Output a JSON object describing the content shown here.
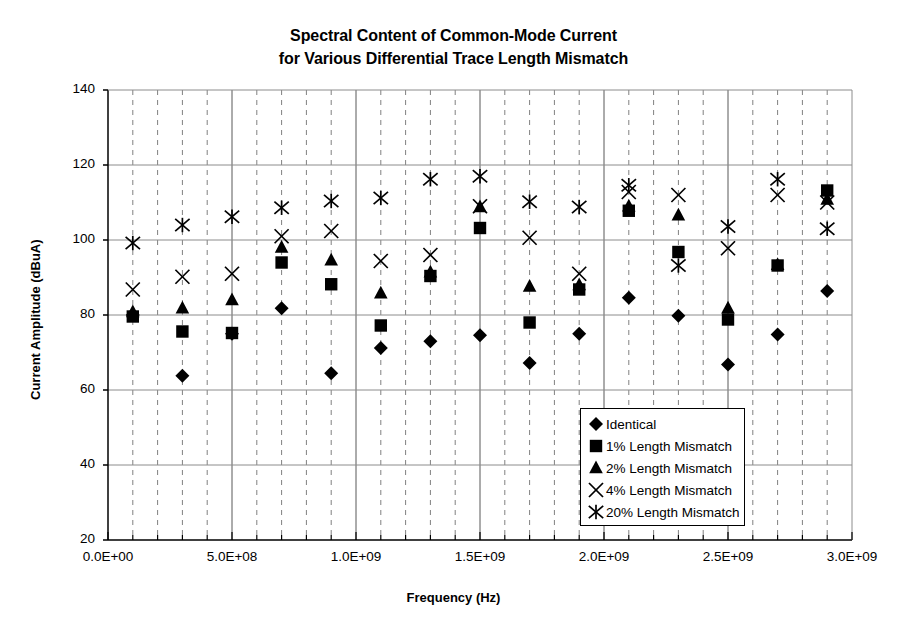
{
  "chart_data": {
    "type": "scatter",
    "title": "Spectral Content of Common-Mode Current for Various Differential Trace Length Mismatch",
    "title_lines": [
      "Spectral Content of Common-Mode Current",
      "for Various Differential Trace Length Mismatch"
    ],
    "xlabel": "Frequency (Hz)",
    "ylabel": "Current Amplitude (dBuA)",
    "xlim": [
      0,
      3000000000
    ],
    "ylim": [
      20,
      140
    ],
    "xticks": [
      0,
      500000000,
      1000000000,
      1500000000,
      2000000000,
      2500000000,
      3000000000
    ],
    "xtick_labels": [
      "0.0E+00",
      "5.0E+08",
      "1.0E+09",
      "1.5E+09",
      "2.0E+09",
      "2.5E+09",
      "3.0E+09"
    ],
    "yticks": [
      20,
      40,
      60,
      80,
      100,
      120,
      140
    ],
    "ytick_labels": [
      "20",
      "40",
      "60",
      "80",
      "100",
      "120",
      "140"
    ],
    "x_minor_step": 100000000,
    "x_major_step": 500000000,
    "grid": "major-horizontal-solid, minor-vertical-dashed, major-vertical-solid",
    "legend_position": "inside lower right",
    "marker_color": "#000000",
    "axis_color": "#000000",
    "grid_color": "#808080",
    "series": [
      {
        "name": "Identical",
        "marker": "diamond",
        "points": [
          [
            100000000,
            80.0
          ],
          [
            300000000,
            63.8
          ],
          [
            500000000,
            75.0
          ],
          [
            700000000,
            81.8
          ],
          [
            900000000,
            64.5
          ],
          [
            1100000000,
            71.2
          ],
          [
            1300000000,
            73.0
          ],
          [
            1500000000,
            74.6
          ],
          [
            1700000000,
            67.2
          ],
          [
            1900000000,
            75.0
          ],
          [
            2100000000,
            84.6
          ],
          [
            2300000000,
            79.8
          ],
          [
            2500000000,
            66.8
          ],
          [
            2700000000,
            74.8
          ],
          [
            2900000000,
            86.4
          ]
        ]
      },
      {
        "name": "1% Length Mismatch",
        "marker": "square",
        "points": [
          [
            100000000,
            79.6
          ],
          [
            300000000,
            75.6
          ],
          [
            500000000,
            75.2
          ],
          [
            700000000,
            94.0
          ],
          [
            900000000,
            88.2
          ],
          [
            1100000000,
            77.2
          ],
          [
            1300000000,
            90.4
          ],
          [
            1500000000,
            103.2
          ],
          [
            1700000000,
            78.0
          ],
          [
            1900000000,
            86.8
          ],
          [
            2100000000,
            107.8
          ],
          [
            2300000000,
            96.8
          ],
          [
            2500000000,
            78.8
          ],
          [
            2700000000,
            93.2
          ],
          [
            2900000000,
            113.2
          ]
        ]
      },
      {
        "name": "2% Length Mismatch",
        "marker": "triangle",
        "points": [
          [
            100000000,
            80.8
          ],
          [
            300000000,
            81.8
          ],
          [
            500000000,
            84.0
          ],
          [
            700000000,
            98.0
          ],
          [
            900000000,
            94.6
          ],
          [
            1100000000,
            85.8
          ],
          [
            1300000000,
            91.4
          ],
          [
            1500000000,
            108.8
          ],
          [
            1700000000,
            87.6
          ],
          [
            1900000000,
            88.0
          ],
          [
            2100000000,
            109.0
          ],
          [
            2300000000,
            106.6
          ],
          [
            2500000000,
            81.8
          ],
          [
            2700000000,
            93.4
          ],
          [
            2900000000,
            110.8
          ]
        ]
      },
      {
        "name": "4% Length Mismatch",
        "marker": "x",
        "points": [
          [
            100000000,
            86.8
          ],
          [
            300000000,
            90.2
          ],
          [
            500000000,
            91.0
          ],
          [
            700000000,
            101.0
          ],
          [
            900000000,
            102.4
          ],
          [
            1100000000,
            94.4
          ],
          [
            1300000000,
            96.0
          ],
          [
            1500000000,
            109.0
          ],
          [
            1700000000,
            100.6
          ],
          [
            1900000000,
            91.0
          ],
          [
            2100000000,
            112.8
          ],
          [
            2300000000,
            112.0
          ],
          [
            2500000000,
            97.8
          ],
          [
            2700000000,
            112.0
          ],
          [
            2900000000,
            110.0
          ]
        ]
      },
      {
        "name": "20% Length Mismatch",
        "marker": "asterisk",
        "points": [
          [
            100000000,
            99.2
          ],
          [
            300000000,
            104.0
          ],
          [
            500000000,
            106.2
          ],
          [
            700000000,
            108.6
          ],
          [
            900000000,
            110.4
          ],
          [
            1100000000,
            111.2
          ],
          [
            1300000000,
            116.2
          ],
          [
            1500000000,
            117.0
          ],
          [
            1700000000,
            110.2
          ],
          [
            1900000000,
            108.8
          ],
          [
            2100000000,
            114.6
          ],
          [
            2300000000,
            93.2
          ],
          [
            2500000000,
            103.6
          ],
          [
            2700000000,
            116.2
          ],
          [
            2900000000,
            103.0
          ]
        ]
      }
    ],
    "legend": [
      {
        "label": "Identical",
        "marker": "diamond"
      },
      {
        "label": "1% Length Mismatch",
        "marker": "square"
      },
      {
        "label": "2% Length Mismatch",
        "marker": "triangle"
      },
      {
        "label": "4% Length Mismatch",
        "marker": "x"
      },
      {
        "label": "20% Length Mismatch",
        "marker": "asterisk"
      }
    ]
  }
}
